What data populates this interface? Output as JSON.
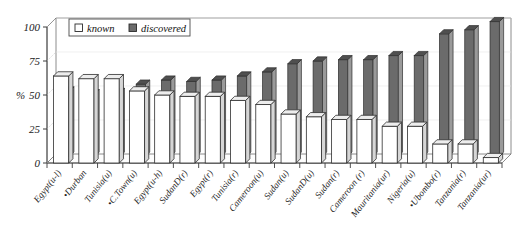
{
  "chart_data": {
    "type": "bar",
    "title": "",
    "subtitle": "",
    "xlabel": "",
    "ylabel": "%",
    "ylim": [
      0,
      100
    ],
    "yticks": [
      0,
      25,
      50,
      75,
      100
    ],
    "grid": false,
    "legend_position": "top-left",
    "legend": [
      "known",
      "discovered"
    ],
    "categories": [
      "Egypt(u-l)",
      "•Durban",
      "Tunisia(u)",
      "•C.Town(u)",
      "Egypt(u-h)",
      "SudanD(r)",
      "Egypt(r)",
      "Tunisia(r)",
      "Cameroon(u)",
      "Sudan(u)",
      "SudanD(u)",
      "Sudan(r)",
      "Cameroon (r)",
      "Mauritania(ur)",
      "Nigeria(u)",
      "•Ubombo(r)",
      "Tanzania(r)",
      "Tanzania(ur)"
    ],
    "series": [
      {
        "name": "known",
        "color": "#ffffff",
        "values": [
          64,
          62,
          62,
          53,
          50,
          49,
          49,
          46,
          43,
          36,
          34,
          32,
          32,
          27,
          27,
          14,
          14,
          4
        ]
      },
      {
        "name": "discovered",
        "color": "#6b6b6b",
        "values": [
          48,
          46,
          47,
          53,
          56,
          55,
          56,
          59,
          62,
          68,
          70,
          71,
          71,
          74,
          74,
          90,
          93,
          99
        ]
      }
    ]
  },
  "axis": {
    "y_title": "%",
    "tick_100": "100",
    "tick_75": "75",
    "tick_50": "50",
    "tick_25": "25",
    "tick_0": "0"
  },
  "legend": {
    "known_label": "known",
    "discovered_label": "discovered"
  }
}
